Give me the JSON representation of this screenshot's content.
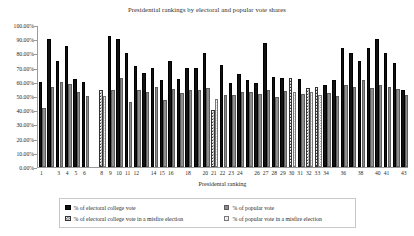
{
  "chart_data": {
    "type": "bar",
    "title": "Presidential rankings by electoral and popular vote shares",
    "xlabel": "Presidental ranking",
    "ylabel": "",
    "ylim": [
      0,
      1.0
    ],
    "grid": false,
    "legend_position": "bottom",
    "y_tick_labels": [
      "0.00%",
      "10.00%",
      "20.00%",
      "30.00%",
      "40.00%",
      "50.00%",
      "60.00%",
      "70.00%",
      "80.00%",
      "90.00%",
      "100.00%"
    ],
    "y_tick_values": [
      0,
      0.1,
      0.2,
      0.3,
      0.4,
      0.5,
      0.6,
      0.7,
      0.8,
      0.9,
      1.0
    ],
    "x_tick_labels": [
      "1",
      "3",
      "4",
      "5",
      "6",
      "8",
      "9",
      "10",
      "11",
      "12",
      "14",
      "15",
      "16",
      "18",
      "20",
      "21",
      "22",
      "23",
      "24",
      "26",
      "27",
      "28",
      "29",
      "30",
      "31",
      "32",
      "33",
      "34",
      "36",
      "38",
      "40",
      "41",
      "43"
    ],
    "categories": [
      1,
      2,
      3,
      4,
      5,
      6,
      7,
      8,
      9,
      10,
      11,
      12,
      13,
      14,
      15,
      16,
      17,
      18,
      19,
      20,
      21,
      22,
      23,
      24,
      25,
      26,
      27,
      28,
      29,
      30,
      31,
      32,
      33,
      34,
      35,
      36,
      37,
      38,
      39,
      40,
      41,
      42,
      43
    ],
    "series": [
      {
        "name": "% of electoral college vote",
        "key": "electoral",
        "values": [
          0.6,
          0.9,
          0.745,
          0.85,
          0.62,
          0.6,
          null,
          null,
          0.92,
          0.9,
          0.8,
          0.71,
          0.665,
          0.7,
          0.615,
          0.745,
          0.62,
          0.7,
          0.7,
          0.8,
          null,
          0.72,
          0.595,
          0.655,
          0.61,
          0.595,
          0.875,
          0.635,
          0.625,
          null,
          0.62,
          null,
          null,
          0.575,
          0.61,
          0.84,
          0.8,
          0.745,
          0.835,
          0.9,
          0.8,
          0.73,
          0.545
        ]
      },
      {
        "name": "% of popular vote",
        "key": "popular",
        "values": [
          0.415,
          0.565,
          0.6,
          0.585,
          0.525,
          0.5,
          null,
          null,
          0.545,
          0.625,
          0.455,
          0.545,
          0.53,
          0.565,
          0.47,
          0.55,
          0.52,
          0.545,
          0.545,
          0.555,
          null,
          0.51,
          0.505,
          0.53,
          0.53,
          0.515,
          0.545,
          0.49,
          0.535,
          null,
          0.515,
          null,
          null,
          0.52,
          0.5,
          0.575,
          0.56,
          0.615,
          0.555,
          0.575,
          0.56,
          0.55,
          0.51
        ]
      },
      {
        "name": "% of electoral college vote in a misfire election",
        "key": "electoral_misfire",
        "values": [
          null,
          null,
          null,
          null,
          null,
          null,
          null,
          0.545,
          null,
          null,
          null,
          null,
          null,
          null,
          null,
          null,
          null,
          null,
          null,
          null,
          0.4,
          null,
          null,
          null,
          null,
          null,
          null,
          null,
          null,
          0.625,
          null,
          0.555,
          0.565,
          null,
          null,
          null,
          null,
          null,
          null,
          null,
          null,
          null,
          null
        ]
      },
      {
        "name": "% of popular vote in a misfire election",
        "key": "popular_misfire",
        "values": [
          null,
          null,
          null,
          null,
          null,
          null,
          null,
          0.5,
          null,
          null,
          null,
          null,
          null,
          null,
          null,
          null,
          null,
          null,
          null,
          null,
          0.48,
          null,
          null,
          null,
          null,
          null,
          null,
          null,
          null,
          0.525,
          null,
          0.525,
          0.51,
          null,
          null,
          null,
          null,
          null,
          null,
          null,
          null,
          null,
          null
        ]
      }
    ],
    "misfire_rankings": [
      8,
      21,
      30,
      32,
      33
    ],
    "colors": {
      "electoral": "#111111",
      "popular": "#8e8e8e",
      "electoral_misfire": "#444444",
      "popular_misfire": "#777777",
      "axis": "#9a9a9a",
      "text": "#2b2b2b",
      "legend_border": "#c9c9c9",
      "background": "#ffffff"
    }
  },
  "legend": {
    "entries": [
      {
        "label": "% of electoral college vote",
        "swatch": "sw-electoral",
        "icon": "electoral-swatch-icon"
      },
      {
        "label": "% of popular vote",
        "swatch": "sw-popular",
        "icon": "popular-swatch-icon"
      },
      {
        "label": "% of electoral college vote in a misfire election",
        "swatch": "sw-electoral-misfire",
        "icon": "electoral-misfire-swatch-icon"
      },
      {
        "label": "% of popular vote in a misfire election",
        "swatch": "sw-popular-misfire",
        "icon": "popular-misfire-swatch-icon"
      }
    ]
  }
}
